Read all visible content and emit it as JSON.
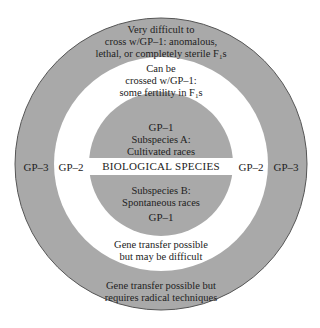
{
  "diagram": {
    "type": "concentric-gene-pool",
    "colors": {
      "gp3_ring": "#a9a9a9",
      "gp2_ring": "#ffffff",
      "gp1_core": "#a9a9a9",
      "band": "#ffffff",
      "outline": "#555555",
      "text": "#222222"
    },
    "gp3": {
      "left_label": "GP–3",
      "right_label": "GP–3",
      "top_text": [
        "Very difficult to",
        "cross w/GP–1: anomalous,",
        "lethal, or completely sterile F"
      ],
      "top_text_sub": "1",
      "top_text_suffix": "s",
      "bottom_text": [
        "Gene transfer possible but",
        "requires radical techniques"
      ]
    },
    "gp2": {
      "left_label": "GP–2",
      "right_label": "GP–2",
      "top_text": [
        "Can be",
        "crossed w/GP–1:",
        "some fertility in F"
      ],
      "top_text_sub": "1",
      "top_text_suffix": "s",
      "bottom_text": [
        "Gene transfer possible",
        "but may be difficult"
      ]
    },
    "gp1": {
      "top_label": "GP–1",
      "top_text": [
        "Subspecies A:",
        "Cultivated races"
      ],
      "band_label": "BIOLOGICAL SPECIES",
      "bottom_text": [
        "Subspecies B:",
        "Spontaneous races"
      ],
      "bottom_label": "GP–1"
    }
  }
}
